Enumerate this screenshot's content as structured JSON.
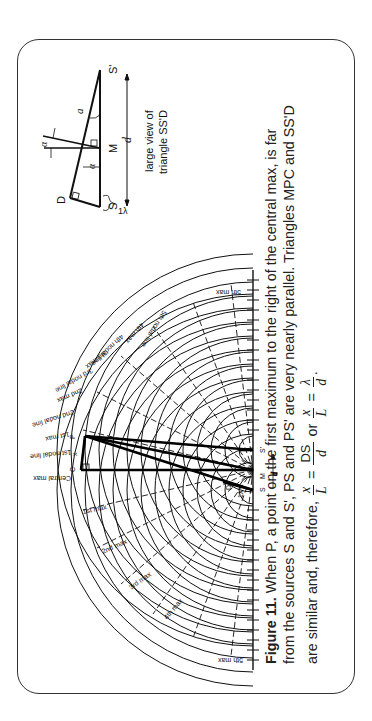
{
  "figure": {
    "number_label": "Figure 11.",
    "caption_lines": [
      "When P, a point on the first maximum to the right of the central max, is far",
      "from the sources S and S', PS and PS' are very nearly parallel. Triangles MPC and SS'D",
      "are similar and, therefore,"
    ],
    "equation": {
      "frac1": {
        "num": "x",
        "den": "L"
      },
      "eq": "=",
      "frac2": {
        "num": "DS",
        "den": "d"
      },
      "or": "or",
      "frac3": {
        "num": "x",
        "den": "L"
      },
      "frac4": {
        "num": "λ",
        "den": "d"
      },
      "end": "."
    }
  },
  "diagram": {
    "left_labels": [
      "Central max",
      "1st nodal line",
      "1st max",
      "2nd nodal line",
      "2nd max",
      "3rd nodal line",
      "3rd max",
      "4th nodal line",
      "4th max",
      "5th nodal line",
      "5th max"
    ],
    "right_labels": [
      "1st max",
      "2nd max",
      "3rd max",
      "4th max",
      "5th max"
    ],
    "points": {
      "C": "C",
      "P": "P",
      "x": "x",
      "M": "M",
      "S": "S",
      "S_prime": "S'",
      "D": "D",
      "L": "L",
      "one_lambda": "1λ",
      "d": "d"
    }
  },
  "inset": {
    "caption_line1": "large view of",
    "caption_line2": "triangle SS'D",
    "labels": {
      "S": "S",
      "S_prime": "S'",
      "M": "M",
      "D": "D",
      "alpha": "α",
      "alpha2": "α",
      "a": "a",
      "one_lambda": "1λ",
      "d": "d"
    }
  }
}
